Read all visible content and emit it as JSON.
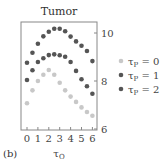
{
  "panel_label": "(b)",
  "chart_data": {
    "type": "scatter",
    "title": "Tumor",
    "xlabel": "τO",
    "ylabel": "",
    "xlim": [
      -0.5,
      6.5
    ],
    "ylim": [
      6,
      10.5
    ],
    "xticks": [
      0,
      1,
      2,
      3,
      4,
      5,
      6
    ],
    "yticks": [
      6,
      8,
      10
    ],
    "y_axis_position": "right",
    "grid": false,
    "legend_position": "right",
    "x": [
      0,
      0.5,
      1,
      1.5,
      2,
      2.5,
      3,
      3.5,
      4,
      4.5,
      5,
      5.5,
      6
    ],
    "series": [
      {
        "name": "τP = 0",
        "color": "#c8c8c8",
        "values": [
          7.07,
          7.61,
          8.0,
          8.26,
          8.46,
          8.26,
          7.93,
          7.61,
          7.35,
          7.13,
          6.9,
          6.71,
          6.55
        ]
      },
      {
        "name": "τP = 1",
        "color": "#555555",
        "values": [
          8.04,
          8.45,
          8.79,
          8.95,
          9.08,
          9.11,
          9.07,
          9.01,
          8.79,
          8.42,
          8.07,
          7.78,
          7.47
        ]
      },
      {
        "name": "τP = 2",
        "color": "#555555",
        "values": [
          8.76,
          9.18,
          9.55,
          9.86,
          10.05,
          10.18,
          10.18,
          10.07,
          9.85,
          9.65,
          9.47,
          9.25,
          8.83
        ]
      }
    ]
  }
}
